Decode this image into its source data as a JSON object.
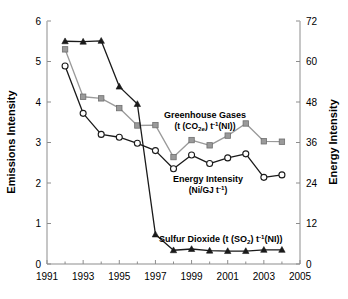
{
  "chart_data": {
    "type": "line",
    "title": "",
    "xlabel": "",
    "ylabel": "Emissions Intensity",
    "y2label": "Energy Intensity",
    "x": [
      1992,
      1993,
      1994,
      1995,
      1996,
      1997,
      1998,
      1999,
      2000,
      2001,
      2002,
      2003,
      2004
    ],
    "xlim": [
      1991,
      2005
    ],
    "ylim": [
      0,
      6
    ],
    "y2lim": [
      0,
      72
    ],
    "xticks": [
      1991,
      1993,
      1995,
      1997,
      1999,
      2001,
      2003,
      2005
    ],
    "xticklabels": [
      "1991",
      "1993",
      "1995",
      "1997",
      "1999",
      "2001",
      "2003",
      "2005"
    ],
    "yticks": [
      0,
      1,
      2,
      3,
      4,
      5,
      6
    ],
    "yticklabels": [
      "0",
      "1",
      "2",
      "3",
      "4",
      "5",
      "6"
    ],
    "y2ticks": [
      0,
      12,
      24,
      36,
      48,
      60,
      72
    ],
    "y2ticklabels": [
      "0",
      "12",
      "24",
      "36",
      "48",
      "60",
      "72"
    ],
    "grid": false,
    "legend": "inline-annotations",
    "series": [
      {
        "name": "Greenhouse Gases",
        "axis": "left",
        "marker": "square",
        "marker_color": "#9a9a9a",
        "line_color": "#9a9a9a",
        "values": [
          5.3,
          4.13,
          4.09,
          3.85,
          3.42,
          3.43,
          2.64,
          3.06,
          2.93,
          3.17,
          3.47,
          3.03,
          3.02
        ]
      },
      {
        "name": "Energy Intensity",
        "axis": "right",
        "marker": "circle-open",
        "marker_color": "#ffffff",
        "line_color": "#1a1a1a",
        "values": [
          4.89,
          3.72,
          3.2,
          3.13,
          2.98,
          2.8,
          2.35,
          2.69,
          2.48,
          2.62,
          2.72,
          2.14,
          2.2
        ]
      },
      {
        "name": "Sulfur Dioxide",
        "axis": "left",
        "marker": "triangle",
        "marker_color": "#1a1a1a",
        "line_color": "#1a1a1a",
        "values": [
          5.5,
          5.49,
          5.51,
          4.38,
          3.95,
          0.73,
          0.34,
          0.37,
          0.33,
          0.32,
          0.32,
          0.35,
          0.35
        ]
      }
    ],
    "annotations": [
      {
        "name": "greenhouse-gases",
        "line1": "Greenhouse Gases",
        "line2_pre": "(t (CO",
        "line2_sub": "2e",
        "line2_mid": ") t",
        "line2_sup": "-1",
        "line2_post": "(NI))",
        "x": 205,
        "y": 118
      },
      {
        "name": "energy-intensity",
        "line1": "Energy Intensity",
        "line2_pre": "(Ni/GJ t",
        "line2_sup": "-1",
        "line2_post": ")",
        "x": 208,
        "y": 182
      },
      {
        "name": "sulfur-dioxide",
        "line1_pre": "Sulfur Dioxide (t (SO",
        "line1_sub": "2",
        "line1_mid": ") t",
        "line1_sup": "-1",
        "line1_post": "(NI))",
        "x": 159,
        "y": 242
      }
    ]
  }
}
